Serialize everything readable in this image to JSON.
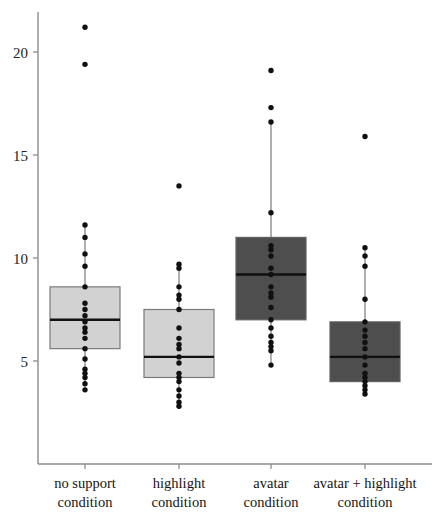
{
  "chart_data": {
    "type": "box",
    "title": "",
    "xlabel": "",
    "ylabel": "",
    "ylim": [
      2.6,
      21.9
    ],
    "yticks": [
      5,
      10,
      15,
      20
    ],
    "ytick_labels": [
      "5",
      "10",
      "15",
      "20"
    ],
    "grid": false,
    "legend": false,
    "categories": [
      "no support condition",
      "highlight condition",
      "avatar condition",
      "avatar + highlight condition"
    ],
    "category_lines": [
      [
        "no support",
        "condition"
      ],
      [
        "highlight",
        "condition"
      ],
      [
        "avatar",
        "condition"
      ],
      [
        "avatar + highlight",
        "condition"
      ]
    ],
    "boxes": [
      {
        "name": "no support condition",
        "fill": "#d2d2d2",
        "whisker_low": 3.6,
        "q1": 5.6,
        "median": 7.0,
        "q3": 8.6,
        "whisker_high": 11.6,
        "outliers": [
          19.4,
          21.2
        ],
        "points": [
          3.6,
          3.9,
          4.2,
          4.4,
          4.6,
          5.1,
          5.6,
          6.1,
          6.4,
          6.6,
          6.9,
          7.2,
          7.5,
          7.8,
          8.6,
          9.6,
          10.2,
          11.0,
          11.6,
          19.4,
          21.2
        ]
      },
      {
        "name": "highlight condition",
        "fill": "#d2d2d2",
        "whisker_low": 2.8,
        "q1": 4.2,
        "median": 5.2,
        "q3": 7.5,
        "whisker_high": 9.7,
        "outliers": [
          13.5
        ],
        "points": [
          2.8,
          3.0,
          3.3,
          3.6,
          4.0,
          4.2,
          4.4,
          4.9,
          5.2,
          5.6,
          5.8,
          6.1,
          6.6,
          7.5,
          8.0,
          8.2,
          8.6,
          9.5,
          9.7,
          13.5
        ]
      },
      {
        "name": "avatar condition",
        "fill": "#4e4e4e",
        "whisker_low": 4.8,
        "q1": 7.0,
        "median": 9.2,
        "q3": 11.0,
        "whisker_high": 16.6,
        "outliers": [
          17.3,
          19.1
        ],
        "points": [
          4.8,
          5.5,
          5.7,
          5.9,
          6.2,
          6.6,
          7.0,
          7.6,
          8.1,
          8.3,
          8.6,
          9.2,
          9.5,
          10.1,
          10.4,
          10.6,
          12.2,
          16.6,
          17.3,
          19.1
        ]
      },
      {
        "name": "avatar + highlight condition",
        "fill": "#4e4e4e",
        "whisker_low": 3.4,
        "q1": 4.0,
        "median": 5.2,
        "q3": 6.9,
        "whisker_high": 10.5,
        "outliers": [
          15.9
        ],
        "points": [
          3.4,
          3.6,
          3.8,
          4.0,
          4.2,
          4.4,
          4.8,
          5.2,
          5.6,
          5.9,
          6.2,
          6.5,
          6.9,
          8.0,
          9.6,
          10.1,
          10.5,
          15.9
        ]
      }
    ]
  },
  "axes": {
    "y_axis_name": "value-axis",
    "x_axis_name": "condition-axis"
  }
}
